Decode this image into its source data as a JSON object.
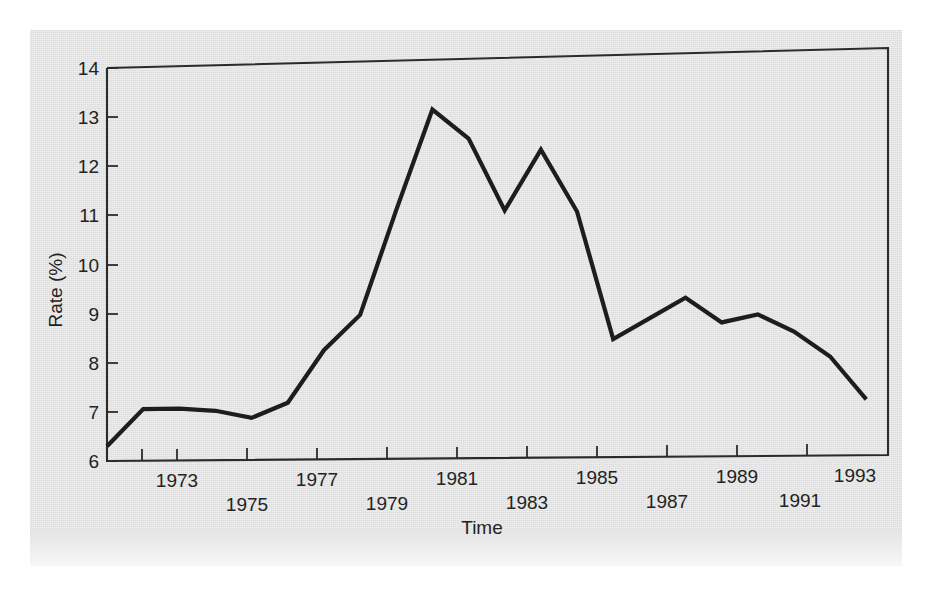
{
  "figure": {
    "background_color": "#e4e4e4",
    "page_color": "#ffffff",
    "line_color": "#1d1d1d",
    "axis_color": "#2b2b2b",
    "text_color": "#232323"
  },
  "chart_data": {
    "type": "line",
    "title": "",
    "xlabel": "Time",
    "ylabel": "Rate (%)",
    "xlim": [
      1972,
      1993.6
    ],
    "ylim": [
      6,
      14
    ],
    "grid": false,
    "legend": null,
    "ytick_labels": [
      "6",
      "7",
      "8",
      "9",
      "10",
      "11",
      "12",
      "13",
      "14"
    ],
    "yticks": [
      6,
      7,
      8,
      9,
      10,
      11,
      12,
      13,
      14
    ],
    "xticks": [
      1973,
      1975,
      1977,
      1979,
      1981,
      1983,
      1985,
      1987,
      1989,
      1991,
      1993
    ],
    "xtick_labels_upper": [
      "1973",
      "1977",
      "1981",
      "1985",
      "1989",
      "1993"
    ],
    "xtick_labels_lower": [
      "1975",
      "1979",
      "1983",
      "1987",
      "1991"
    ],
    "xtick_rows": [
      {
        "label": "1973",
        "year": 1973,
        "row": "upper"
      },
      {
        "label": "1975",
        "year": 1975,
        "row": "lower"
      },
      {
        "label": "1977",
        "year": 1977,
        "row": "upper"
      },
      {
        "label": "1979",
        "year": 1979,
        "row": "lower"
      },
      {
        "label": "1981",
        "year": 1981,
        "row": "upper"
      },
      {
        "label": "1983",
        "year": 1983,
        "row": "lower"
      },
      {
        "label": "1985",
        "year": 1985,
        "row": "upper"
      },
      {
        "label": "1987",
        "year": 1987,
        "row": "lower"
      },
      {
        "label": "1989",
        "year": 1989,
        "row": "upper"
      },
      {
        "label": "1991",
        "year": 1991,
        "row": "lower"
      },
      {
        "label": "1993",
        "year": 1993,
        "row": "upper"
      }
    ],
    "x": [
      1972,
      1973,
      1974,
      1975,
      1976,
      1977,
      1978,
      1979,
      1980,
      1981,
      1982,
      1983,
      1984,
      1985,
      1986,
      1987,
      1988,
      1989,
      1990,
      1991,
      1992,
      1993
    ],
    "values": [
      6.3,
      7.05,
      7.05,
      7.0,
      6.85,
      7.15,
      8.2,
      8.9,
      11.0,
      13.0,
      12.4,
      10.95,
      12.15,
      10.9,
      8.35,
      8.75,
      9.15,
      8.65,
      8.8,
      8.45,
      7.95,
      7.1
    ],
    "series": [
      {
        "name": "Rate (%)",
        "values": [
          6.3,
          7.05,
          7.05,
          7.0,
          6.85,
          7.15,
          8.2,
          8.9,
          11.0,
          13.0,
          12.4,
          10.95,
          12.15,
          10.9,
          8.35,
          8.75,
          9.15,
          8.65,
          8.8,
          8.45,
          7.95,
          7.1
        ]
      }
    ]
  }
}
